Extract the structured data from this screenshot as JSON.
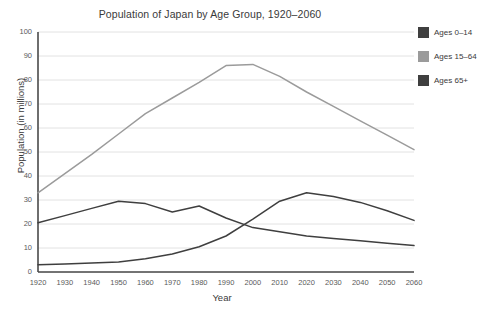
{
  "chart_data": {
    "type": "line",
    "title": "Population of Japan by Age Group, 1920–2060",
    "xlabel": "Year",
    "ylabel": "Population (in millions)",
    "xlim": [
      1920,
      2060
    ],
    "ylim": [
      0,
      100
    ],
    "ytick_step": 10,
    "grid": true,
    "legend_position": "right",
    "x": [
      1920,
      1930,
      1940,
      1950,
      1960,
      1970,
      1980,
      1990,
      2000,
      2010,
      2020,
      2030,
      2040,
      2050,
      2060
    ],
    "xticks": [
      "1920",
      "1930",
      "1940",
      "1950",
      "1960",
      "1970",
      "1980",
      "1990",
      "2000",
      "2010",
      "2020",
      "2030",
      "2040",
      "2050",
      "2060"
    ],
    "yticks": [
      "0",
      "10",
      "20",
      "30",
      "40",
      "50",
      "60",
      "70",
      "80",
      "90",
      "100"
    ],
    "series": [
      {
        "name": "Ages 0–14",
        "color": "#3f3f3f",
        "values": [
          20.5,
          23.5,
          26.5,
          29.5,
          28.5,
          25.0,
          27.5,
          22.5,
          18.5,
          16.8,
          15.0,
          14.0,
          13.0,
          12.0,
          11.0
        ]
      },
      {
        "name": "Ages 15–64",
        "color": "#9b9b9b",
        "values": [
          33.0,
          41.0,
          49.0,
          57.5,
          66.0,
          72.5,
          79.0,
          86.0,
          86.5,
          81.5,
          75.0,
          69.0,
          63.0,
          57.0,
          51.0
        ]
      },
      {
        "name": "Ages 65+",
        "color": "#3f3f3f",
        "values": [
          3.0,
          3.3,
          3.7,
          4.2,
          5.5,
          7.5,
          10.5,
          15.0,
          22.0,
          29.5,
          33.0,
          31.5,
          29.0,
          25.5,
          21.5
        ]
      }
    ]
  },
  "legend": {
    "items": [
      {
        "label": "Ages 0–14",
        "color": "#3f3f3f"
      },
      {
        "label": "Ages 15–64",
        "color": "#9b9b9b"
      },
      {
        "label": "Ages 65+",
        "color": "#3f3f3f"
      }
    ]
  },
  "axes": {
    "axis_color": "#4a4a4a",
    "grid_color": "#e2e2e2"
  }
}
